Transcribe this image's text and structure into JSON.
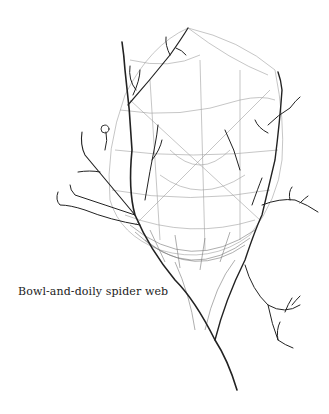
{
  "figure": {
    "caption": "Bowl-and-doily spider web",
    "colors": {
      "background": "#ffffff",
      "ink": "#222222",
      "web": "#9a9a9a"
    }
  }
}
